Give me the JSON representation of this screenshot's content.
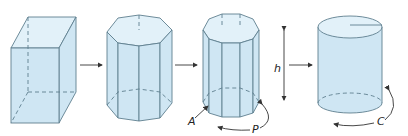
{
  "diagram": {
    "colors": {
      "fill": "#cfe6f3",
      "fill_top": "#e2f1f9",
      "stroke": "#5f7f8f",
      "arrow": "#333333"
    },
    "shapes": [
      {
        "name": "rectangular-prism"
      },
      {
        "name": "hexagonal-prism"
      },
      {
        "name": "octagonal-prism"
      },
      {
        "name": "cylinder"
      }
    ],
    "labels": {
      "area": "A",
      "perimeter": "P",
      "height": "h",
      "circumference": "C"
    }
  }
}
